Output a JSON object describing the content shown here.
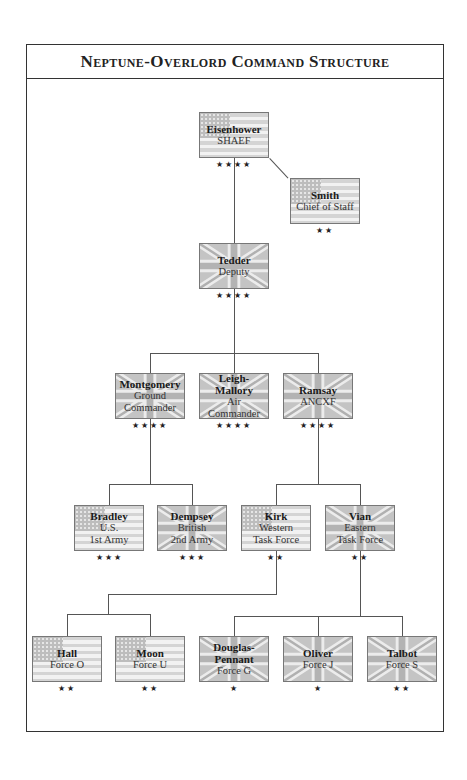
{
  "title": "Neptune-Overlord Command Structure",
  "nodes": [
    {
      "id": "eisenhower",
      "name": "Eisenhower",
      "role": [
        "SHAEF"
      ],
      "nation": "US",
      "stars": "★★★★",
      "x": 199,
      "y": 112
    },
    {
      "id": "smith",
      "name": "Smith",
      "role": [
        "Chief of Staff"
      ],
      "nation": "US",
      "stars": "★★",
      "x": 290,
      "y": 178
    },
    {
      "id": "tedder",
      "name": "Tedder",
      "role": [
        "Deputy"
      ],
      "nation": "UK",
      "stars": "★★★★",
      "x": 199,
      "y": 243
    },
    {
      "id": "montgomery",
      "name": "Montgomery",
      "role": [
        "Ground",
        "Commander"
      ],
      "nation": "UK",
      "stars": "★★★★",
      "x": 115,
      "y": 373
    },
    {
      "id": "leigh-mallory",
      "name": "Leigh-Mallory",
      "role": [
        "Air",
        "Commander"
      ],
      "nation": "UK",
      "stars": "★★★★",
      "x": 199,
      "y": 373
    },
    {
      "id": "ramsay",
      "name": "Ramsay",
      "role": [
        "ANCXF"
      ],
      "nation": "UK",
      "stars": "★★★★",
      "x": 283,
      "y": 373
    },
    {
      "id": "bradley",
      "name": "Bradley",
      "role": [
        "U.S.",
        "1st Army"
      ],
      "nation": "US",
      "stars": "★★★",
      "x": 74,
      "y": 505
    },
    {
      "id": "dempsey",
      "name": "Dempsey",
      "role": [
        "British",
        "2nd Army"
      ],
      "nation": "UK",
      "stars": "★★★",
      "x": 157,
      "y": 505
    },
    {
      "id": "kirk",
      "name": "Kirk",
      "role": [
        "Western",
        "Task Force"
      ],
      "nation": "US",
      "stars": "★★",
      "x": 241,
      "y": 505
    },
    {
      "id": "vian",
      "name": "Vian",
      "role": [
        "Eastern",
        "Task Force"
      ],
      "nation": "UK",
      "stars": "★★",
      "x": 325,
      "y": 505
    },
    {
      "id": "hall",
      "name": "Hall",
      "role": [
        "Force O"
      ],
      "nation": "US",
      "stars": "★★",
      "x": 32,
      "y": 636
    },
    {
      "id": "moon",
      "name": "Moon",
      "role": [
        "Force U"
      ],
      "nation": "US",
      "stars": "★★",
      "x": 115,
      "y": 636
    },
    {
      "id": "douglas-pennant",
      "name": "Douglas-Pennant",
      "nameLines": [
        "Douglas-",
        "Pennant"
      ],
      "role": [
        "Force G"
      ],
      "nation": "UK",
      "stars": "★",
      "x": 199,
      "y": 636
    },
    {
      "id": "oliver",
      "name": "Oliver",
      "role": [
        "Force J"
      ],
      "nation": "UK",
      "stars": "★",
      "x": 283,
      "y": 636
    },
    {
      "id": "talbot",
      "name": "Talbot",
      "role": [
        "Force S"
      ],
      "nation": "UK",
      "stars": "★★",
      "x": 367,
      "y": 636
    }
  ],
  "edges": [
    [
      "eisenhower",
      "smith"
    ],
    [
      "eisenhower",
      "tedder"
    ],
    [
      "tedder",
      "montgomery"
    ],
    [
      "tedder",
      "leigh-mallory"
    ],
    [
      "tedder",
      "ramsay"
    ],
    [
      "montgomery",
      "bradley"
    ],
    [
      "montgomery",
      "dempsey"
    ],
    [
      "ramsay",
      "kirk"
    ],
    [
      "ramsay",
      "vian"
    ],
    [
      "kirk",
      "hall"
    ],
    [
      "kirk",
      "moon"
    ],
    [
      "vian",
      "douglas-pennant"
    ],
    [
      "vian",
      "oliver"
    ],
    [
      "vian",
      "talbot"
    ]
  ],
  "colors": {
    "line": "#555555",
    "flag_us_stripe": "#d4d4d4",
    "flag_uk_field": "#c4c4c4",
    "frame": "#333333"
  }
}
